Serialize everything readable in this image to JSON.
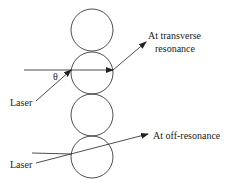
{
  "diagram": {
    "labels": {
      "transverse_line1": "At transverse",
      "transverse_line2": "resonance",
      "off_resonance": "At off-resonance",
      "laser_top": "Laser",
      "laser_bottom": "Laser",
      "angle": "θ"
    },
    "circles": [
      {
        "cx": 92,
        "cy": 30,
        "r": 21
      },
      {
        "cx": 92,
        "cy": 73,
        "r": 21
      },
      {
        "cx": 92,
        "cy": 115,
        "r": 21
      },
      {
        "cx": 92,
        "cy": 157,
        "r": 21
      }
    ],
    "colors": {
      "stroke": "#222222",
      "background": "#ffffff"
    }
  }
}
